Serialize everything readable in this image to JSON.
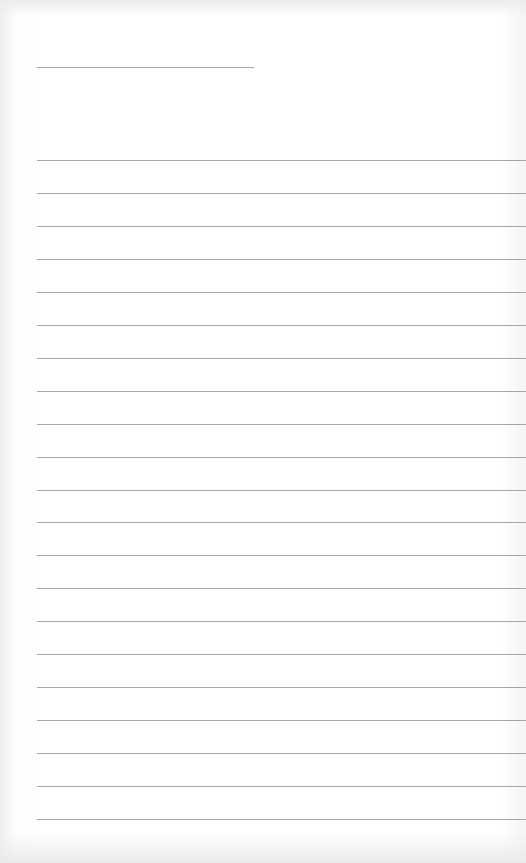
{
  "page": {
    "type": "blank lined paper",
    "background_color": "#ffffff",
    "line_color": "#a6a6a6"
  },
  "header": {
    "name_line": {
      "x": 37,
      "y": 67,
      "width": 217
    }
  },
  "ruled_lines": {
    "count": 21,
    "first_y": 160,
    "spacing": 32.95,
    "left": 37,
    "right": 526
  }
}
